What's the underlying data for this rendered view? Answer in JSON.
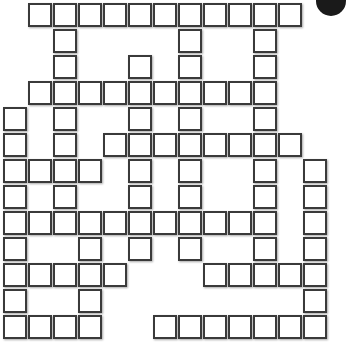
{
  "puzzle": {
    "rows": 13,
    "cols": 13,
    "cell_pitch_x": 25,
    "cell_pitch_y": 26,
    "origin_x": 3,
    "origin_y": 3,
    "border_color": "#3a3a3a",
    "fill_color": "#ffffff",
    "cells_by_row": [
      [
        1,
        2,
        3,
        4,
        5,
        6,
        7,
        8,
        9,
        10,
        11
      ],
      [
        2,
        7,
        10
      ],
      [
        2,
        5,
        7,
        10
      ],
      [
        1,
        2,
        3,
        4,
        5,
        6,
        7,
        8,
        9,
        10
      ],
      [
        0,
        2,
        5,
        7,
        10
      ],
      [
        0,
        2,
        4,
        5,
        6,
        7,
        8,
        9,
        10,
        11
      ],
      [
        0,
        1,
        2,
        3,
        5,
        7,
        10,
        12
      ],
      [
        0,
        2,
        5,
        7,
        10,
        12
      ],
      [
        0,
        1,
        2,
        3,
        4,
        5,
        6,
        7,
        8,
        9,
        10,
        12
      ],
      [
        0,
        3,
        5,
        7,
        10,
        12
      ],
      [
        0,
        1,
        2,
        3,
        4,
        8,
        9,
        10,
        11,
        12
      ],
      [
        0,
        3,
        12
      ],
      [
        0,
        1,
        2,
        3,
        6,
        7,
        8,
        9,
        10,
        11,
        12
      ]
    ]
  },
  "corner_badge": {
    "color": "#1a1a1a"
  }
}
